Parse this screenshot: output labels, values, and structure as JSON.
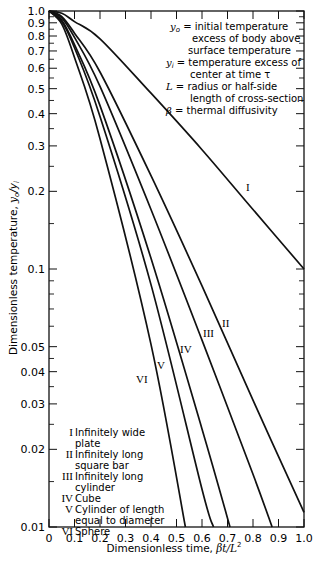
{
  "chart_data": {
    "type": "line",
    "title": "",
    "xlabel": "Dimensionless time, βt/L²",
    "ylabel": "Dimensionless temperature, yo/yi",
    "xlim": [
      0,
      1.0
    ],
    "ylim": [
      0.01,
      1.0
    ],
    "yscale": "log",
    "x_ticks": [
      "0",
      "0.1",
      "0.2",
      "0.3",
      "0.4",
      "0.5",
      "0.6",
      "0.7",
      "0.8",
      "0.9",
      "1.0"
    ],
    "y_ticks": [
      "1.0",
      "0.9",
      "0.8",
      "0.7",
      "0.6",
      "0.5",
      "0.4",
      "0.3",
      "0.2",
      "0.1",
      "0.05",
      "0.04",
      "0.03",
      "0.02",
      "0.01"
    ],
    "grid": false,
    "series": [
      {
        "name": "I",
        "label": "Infinitely wide plate",
        "x": [
          0,
          0.05,
          0.1,
          0.2,
          0.4,
          0.6,
          0.8,
          1.0
        ],
        "y": [
          1.0,
          0.98,
          0.91,
          0.78,
          0.48,
          0.29,
          0.17,
          0.1
        ]
      },
      {
        "name": "II",
        "label": "Infinitely long square bar",
        "x": [
          0,
          0.05,
          0.1,
          0.2,
          0.4,
          0.6,
          0.8,
          1.0
        ],
        "y": [
          1.0,
          0.95,
          0.82,
          0.58,
          0.23,
          0.086,
          0.031,
          0.0114
        ]
      },
      {
        "name": "III",
        "label": "Infinitely long cylinder",
        "x": [
          0,
          0.05,
          0.1,
          0.2,
          0.4,
          0.6,
          0.8,
          0.875
        ],
        "y": [
          1.0,
          0.94,
          0.79,
          0.51,
          0.17,
          0.053,
          0.016,
          0.01
        ]
      },
      {
        "name": "IV",
        "label": "Cube",
        "x": [
          0,
          0.05,
          0.1,
          0.2,
          0.4,
          0.6,
          0.71
        ],
        "y": [
          1.0,
          0.92,
          0.74,
          0.43,
          0.11,
          0.024,
          0.01
        ]
      },
      {
        "name": "V",
        "label": "Cylinder of length equal to diameter",
        "x": [
          0,
          0.05,
          0.1,
          0.2,
          0.4,
          0.6,
          0.645
        ],
        "y": [
          1.0,
          0.91,
          0.72,
          0.39,
          0.087,
          0.014,
          0.01
        ]
      },
      {
        "name": "VI",
        "label": "Sphere",
        "x": [
          0,
          0.05,
          0.1,
          0.2,
          0.4,
          0.535
        ],
        "y": [
          1.0,
          0.89,
          0.66,
          0.32,
          0.051,
          0.01
        ]
      }
    ],
    "annotations": [
      "yo = initial temperature excess of body above surface temperature",
      "yi = temperature excess of center at time τ",
      "L = radius or half-side length of cross-section",
      "β = thermal diffusivity"
    ],
    "legend_position": "lower-left inside"
  },
  "labels": {
    "x_axis": "Dimensionless time, βt/L",
    "x_axis_sup": "2",
    "y_axis": "Dimensionless temperature, yo/yi"
  },
  "notes": [
    {
      "sym": "y",
      "sub": "o",
      "text": " = initial temperature"
    },
    {
      "text": "excess of body above"
    },
    {
      "text": "surface temperature"
    },
    {
      "sym": "y",
      "sub": "i",
      "text": " = temperature excess of"
    },
    {
      "text": "center at time τ"
    },
    {
      "sym": "L",
      "text": " = radius or half-side"
    },
    {
      "text": "length of cross-section"
    },
    {
      "sym": "β",
      "text": " = thermal diffusivity"
    }
  ],
  "legend": [
    {
      "num": "I",
      "line1": "Infinitely wide",
      "line2": "plate"
    },
    {
      "num": "II",
      "line1": "Infinitely long",
      "line2": "square bar"
    },
    {
      "num": "III",
      "line1": "Infinitely long",
      "line2": "cylinder"
    },
    {
      "num": "IV",
      "line1": "Cube",
      "line2": ""
    },
    {
      "num": "V",
      "line1": "Cylinder of length",
      "line2": "equal to diameter"
    },
    {
      "num": "VI",
      "line1": "Sphere",
      "line2": ""
    }
  ]
}
